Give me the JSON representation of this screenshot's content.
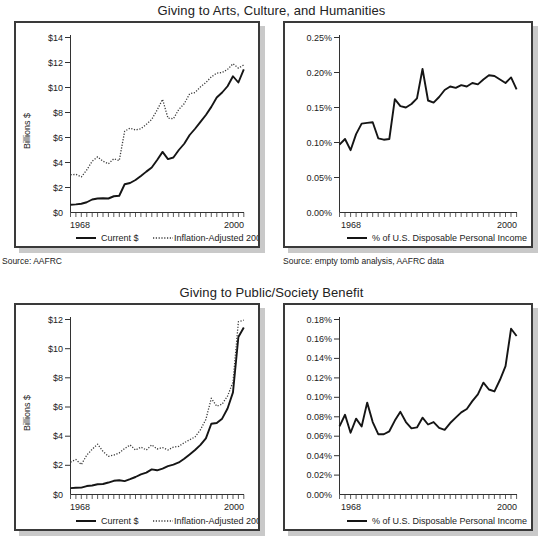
{
  "figure": {
    "background": "#ffffff",
    "line_color": "#151515",
    "panel_border": "#3a3a3a",
    "panel_shadow": "#c9c9c9"
  },
  "charts": [
    {
      "id": "arts-dollars",
      "title": "Giving to Arts, Culture, and Humanities",
      "source": "Source: AAFRC",
      "legend": [
        {
          "label": "Current $",
          "style": "solid"
        },
        {
          "label": "Inflation-Adjusted 2001 $",
          "style": "dotted"
        }
      ],
      "chart_data": {
        "type": "line",
        "title": "Giving to Arts, Culture, and Humanities",
        "xlabel": "",
        "ylabel": "Billions $",
        "xlim": [
          1968,
          2000
        ],
        "ylim": [
          0,
          14
        ],
        "xticklabels": [
          "1968",
          "2000"
        ],
        "yticklabels": [
          "$0",
          "$2",
          "$4",
          "$6",
          "$8",
          "$10",
          "$12",
          "$14"
        ],
        "ytickvalues": [
          0,
          2,
          4,
          6,
          8,
          10,
          12,
          14
        ],
        "grid": false,
        "legend_position": "bottom",
        "x": [
          1968,
          1969,
          1970,
          1971,
          1972,
          1973,
          1974,
          1975,
          1976,
          1977,
          1978,
          1979,
          1980,
          1981,
          1982,
          1983,
          1984,
          1985,
          1986,
          1987,
          1988,
          1989,
          1990,
          1991,
          1992,
          1993,
          1994,
          1995,
          1996,
          1997,
          1998,
          1999,
          2000
        ],
        "series": [
          {
            "name": "Current $",
            "style": "solid",
            "values": [
              0.62,
              0.65,
              0.7,
              0.82,
              1.04,
              1.12,
              1.14,
              1.12,
              1.3,
              1.34,
              2.26,
              2.36,
              2.6,
              2.92,
              3.27,
              3.6,
              4.2,
              4.85,
              4.27,
              4.4,
              5.0,
              5.5,
              6.2,
              6.7,
              7.25,
              7.8,
              8.45,
              9.2,
              9.6,
              10.1,
              10.9,
              10.4,
              11.45
            ]
          },
          {
            "name": "Inflation-Adjusted 2001 $",
            "style": "dotted",
            "values": [
              3.02,
              3.05,
              2.85,
              3.4,
              4.1,
              4.45,
              4.1,
              3.9,
              4.3,
              4.15,
              6.5,
              6.75,
              6.6,
              6.7,
              7.05,
              7.45,
              8.2,
              9.05,
              7.55,
              7.5,
              8.25,
              8.7,
              9.5,
              9.6,
              10.05,
              10.4,
              10.85,
              11.15,
              11.2,
              11.45,
              11.9,
              11.55,
              11.8
            ]
          }
        ]
      }
    },
    {
      "id": "arts-percent",
      "title": "",
      "source": "Source: empty tomb analysis, AAFRC data",
      "legend": [
        {
          "label": "% of U.S. Disposable Personal Income",
          "style": "solid"
        }
      ],
      "chart_data": {
        "type": "line",
        "title": "Giving to Arts, Culture, and Humanities",
        "xlabel": "",
        "ylabel": "",
        "xlim": [
          1968,
          2000
        ],
        "ylim": [
          0,
          0.25
        ],
        "xticklabels": [
          "1968",
          "2000"
        ],
        "yticklabels": [
          "0.00%",
          "0.05%",
          "0.10%",
          "0.15%",
          "0.20%",
          "0.25%"
        ],
        "ytickvalues": [
          0,
          0.05,
          0.1,
          0.15,
          0.2,
          0.25
        ],
        "grid": false,
        "legend_position": "bottom",
        "x": [
          1968,
          1969,
          1970,
          1971,
          1972,
          1973,
          1974,
          1975,
          1976,
          1977,
          1978,
          1979,
          1980,
          1981,
          1982,
          1983,
          1984,
          1985,
          1986,
          1987,
          1988,
          1989,
          1990,
          1991,
          1992,
          1993,
          1994,
          1995,
          1996,
          1997,
          1998,
          1999,
          2000
        ],
        "series": [
          {
            "name": "% of U.S. Disposable Personal Income",
            "style": "solid",
            "values": [
              0.097,
              0.105,
              0.089,
              0.112,
              0.127,
              0.128,
              0.129,
              0.106,
              0.104,
              0.105,
              0.162,
              0.152,
              0.15,
              0.155,
              0.163,
              0.205,
              0.16,
              0.157,
              0.165,
              0.175,
              0.18,
              0.178,
              0.182,
              0.18,
              0.185,
              0.183,
              0.19,
              0.196,
              0.195,
              0.19,
              0.185,
              0.193,
              0.176
            ]
          }
        ]
      }
    },
    {
      "id": "public-dollars",
      "title": "Giving to Public/Society Benefit",
      "source": "",
      "legend": [
        {
          "label": "Current $",
          "style": "solid"
        },
        {
          "label": "Inflation-Adjusted 2001 $",
          "style": "dotted"
        }
      ],
      "chart_data": {
        "type": "line",
        "title": "Giving to Public/Society Benefit",
        "xlabel": "",
        "ylabel": "Billions $",
        "xlim": [
          1968,
          2000
        ],
        "ylim": [
          0,
          12
        ],
        "xticklabels": [
          "1968",
          "2000"
        ],
        "yticklabels": [
          "$0",
          "$2",
          "$4",
          "$6",
          "$8",
          "$10",
          "$12"
        ],
        "ytickvalues": [
          0,
          2,
          4,
          6,
          8,
          10,
          12
        ],
        "grid": false,
        "legend_position": "bottom",
        "x": [
          1968,
          1969,
          1970,
          1971,
          1972,
          1973,
          1974,
          1975,
          1976,
          1977,
          1978,
          1979,
          1980,
          1981,
          1982,
          1983,
          1984,
          1985,
          1986,
          1987,
          1988,
          1989,
          1990,
          1991,
          1992,
          1993,
          1994,
          1995,
          1996,
          1997,
          1998,
          1999,
          2000
        ],
        "series": [
          {
            "name": "Current $",
            "style": "solid",
            "values": [
              0.44,
              0.46,
              0.47,
              0.58,
              0.62,
              0.7,
              0.72,
              0.82,
              0.94,
              0.98,
              0.92,
              1.05,
              1.2,
              1.38,
              1.5,
              1.72,
              1.66,
              1.78,
              1.95,
              2.05,
              2.2,
              2.45,
              2.75,
              3.05,
              3.4,
              3.85,
              4.85,
              4.9,
              5.2,
              5.9,
              7.0,
              10.8,
              11.45
            ]
          },
          {
            "name": "Inflation-Adjusted 2001 $",
            "style": "dotted",
            "values": [
              2.22,
              2.4,
              2.05,
              2.7,
              3.1,
              3.45,
              2.95,
              2.62,
              2.7,
              2.85,
              3.15,
              3.4,
              3.05,
              3.25,
              3.05,
              3.4,
              3.12,
              3.22,
              3.05,
              3.25,
              3.3,
              3.55,
              3.75,
              3.95,
              4.45,
              5.15,
              6.6,
              6.05,
              6.2,
              6.75,
              7.7,
              11.85,
              11.95
            ]
          }
        ]
      }
    },
    {
      "id": "public-percent",
      "title": "",
      "source": "",
      "legend": [
        {
          "label": "% of U.S. Disposable Personal Income",
          "style": "solid"
        }
      ],
      "chart_data": {
        "type": "line",
        "title": "Giving to Public/Society Benefit",
        "xlabel": "",
        "ylabel": "",
        "xlim": [
          1968,
          2000
        ],
        "ylim": [
          0,
          0.18
        ],
        "xticklabels": [
          "1968",
          "2000"
        ],
        "yticklabels": [
          "0.00%",
          "0.02%",
          "0.04%",
          "0.06%",
          "0.08%",
          "0.10%",
          "0.12%",
          "0.14%",
          "0.16%",
          "0.18%"
        ],
        "ytickvalues": [
          0,
          0.02,
          0.04,
          0.06,
          0.08,
          0.1,
          0.12,
          0.14,
          0.16,
          0.18
        ],
        "grid": false,
        "legend_position": "bottom",
        "x": [
          1968,
          1969,
          1970,
          1971,
          1972,
          1973,
          1974,
          1975,
          1976,
          1977,
          1978,
          1979,
          1980,
          1981,
          1982,
          1983,
          1984,
          1985,
          1986,
          1987,
          1988,
          1989,
          1990,
          1991,
          1992,
          1993,
          1994,
          1995,
          1996,
          1997,
          1998,
          1999,
          2000
        ],
        "series": [
          {
            "name": "% of U.S. Disposable Personal Income",
            "style": "solid",
            "values": [
              0.07,
              0.082,
              0.0635,
              0.078,
              0.07,
              0.0945,
              0.0745,
              0.062,
              0.062,
              0.065,
              0.076,
              0.085,
              0.0745,
              0.068,
              0.069,
              0.079,
              0.072,
              0.0745,
              0.0685,
              0.0665,
              0.0735,
              0.079,
              0.0845,
              0.088,
              0.096,
              0.103,
              0.115,
              0.108,
              0.106,
              0.118,
              0.132,
              0.1705,
              0.163
            ]
          }
        ]
      }
    }
  ]
}
